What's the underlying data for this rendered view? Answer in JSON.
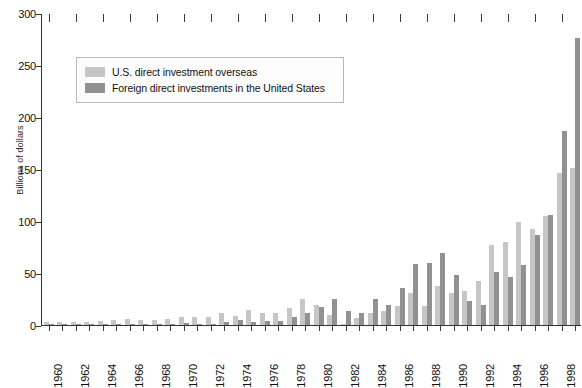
{
  "chart_data": {
    "type": "bar",
    "title": "",
    "subtitle": "",
    "xlabel": "",
    "ylabel": "Billions of dollars",
    "ylim": [
      0,
      300
    ],
    "ytick_step": 50,
    "yticks": [
      0,
      50,
      100,
      150,
      200,
      250,
      300
    ],
    "grid": false,
    "legend_position": "upper-left-inset",
    "categories": [
      "1960",
      "1961",
      "1962",
      "1963",
      "1964",
      "1965",
      "1966",
      "1967",
      "1968",
      "1969",
      "1970",
      "1971",
      "1972",
      "1973",
      "1974",
      "1975",
      "1976",
      "1977",
      "1978",
      "1979",
      "1980",
      "1981",
      "1982",
      "1983",
      "1984",
      "1985",
      "1986",
      "1987",
      "1988",
      "1989",
      "1990",
      "1991",
      "1992",
      "1993",
      "1994",
      "1995",
      "1996",
      "1997",
      "1998",
      "1999"
    ],
    "xtick_labels": [
      "1960",
      "1962",
      "1964",
      "1966",
      "1968",
      "1970",
      "1972",
      "1974",
      "1976",
      "1978",
      "1980",
      "1982",
      "1984",
      "1986",
      "1988",
      "1990",
      "1992",
      "1994",
      "1996",
      "1998"
    ],
    "series": [
      {
        "name": "U.S. direct investment overseas",
        "color": "#c6c6c6",
        "values": [
          2.9,
          2.7,
          2.9,
          3.1,
          3.4,
          5.0,
          5.4,
          4.8,
          5.3,
          5.9,
          7.6,
          7.6,
          7.7,
          11.4,
          9.0,
          14.2,
          11.9,
          11.9,
          16.1,
          25.2,
          19.2,
          9.6,
          0.2,
          6.7,
          11.6,
          13.4,
          18.7,
          31.0,
          17.9,
          37.6,
          30.9,
          32.7,
          42.6,
          77.2,
          80.2,
          98.8,
          91.9,
          104.8,
          146.1,
          150.9
        ]
      },
      {
        "name": "Foreign direct investments in the United States",
        "color": "#919191",
        "values": [
          0.3,
          0.3,
          0.3,
          0.2,
          0.3,
          0.4,
          0.4,
          0.7,
          0.8,
          1.0,
          1.5,
          0.4,
          1.0,
          2.8,
          4.8,
          2.6,
          4.3,
          3.7,
          7.9,
          11.9,
          16.9,
          25.2,
          13.8,
          11.9,
          25.4,
          19.0,
          35.4,
          58.5,
          59.4,
          69.0,
          48.4,
          22.8,
          19.2,
          51.4,
          46.1,
          57.8,
          86.5,
          105.6,
          186.3,
          275.5
        ]
      }
    ]
  },
  "legend": {
    "items": [
      {
        "label": "U.S. direct investment overseas",
        "swatch_class": "us"
      },
      {
        "label": "Foreign direct investments in the United States",
        "swatch_class": "frgn"
      }
    ]
  },
  "axis": {
    "y_title": "Billions of dollars",
    "y_labels": [
      "300",
      "250",
      "200",
      "150",
      "100",
      "50",
      "0"
    ]
  },
  "colors": {
    "series_us": "#c6c6c6",
    "series_foreign": "#919191",
    "axis": "#333333",
    "background": "#ffffff",
    "legend_border": "#b9b9b9"
  }
}
